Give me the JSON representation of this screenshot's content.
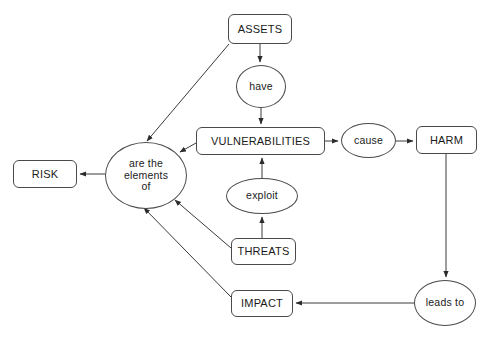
{
  "diagram": {
    "colors": {
      "background": "#ffffff",
      "node_fill": "#ffffff",
      "node_stroke": "#4a4a4a",
      "edge_stroke": "#3a3a3a",
      "text": "#1a1a1a"
    },
    "nodes": [
      {
        "id": "assets",
        "label": "ASSETS",
        "shape": "box",
        "x": 228,
        "y": 14,
        "w": 64,
        "h": 30
      },
      {
        "id": "have",
        "label": "have",
        "shape": "ellipse",
        "x": 236,
        "y": 65,
        "w": 50,
        "h": 43
      },
      {
        "id": "vulnerabilities",
        "label": "VULNERABILITIES",
        "shape": "box",
        "x": 196,
        "y": 127,
        "w": 129,
        "h": 28
      },
      {
        "id": "cause",
        "label": "cause",
        "shape": "ellipse",
        "x": 341,
        "y": 123,
        "w": 55,
        "h": 35
      },
      {
        "id": "harm",
        "label": "HARM",
        "shape": "box",
        "x": 416,
        "y": 126,
        "w": 61,
        "h": 28
      },
      {
        "id": "risk",
        "label": "RISK",
        "shape": "box",
        "x": 13,
        "y": 160,
        "w": 64,
        "h": 28
      },
      {
        "id": "elements",
        "label": "are the\nelements\nof",
        "shape": "ellipse",
        "x": 105,
        "y": 142,
        "w": 82,
        "h": 67
      },
      {
        "id": "exploit",
        "label": "exploit",
        "shape": "ellipse",
        "x": 226,
        "y": 178,
        "w": 72,
        "h": 36
      },
      {
        "id": "threats",
        "label": "THREATS",
        "shape": "box",
        "x": 231,
        "y": 238,
        "w": 65,
        "h": 27
      },
      {
        "id": "impact",
        "label": "IMPACT",
        "shape": "box",
        "x": 231,
        "y": 290,
        "w": 62,
        "h": 27
      },
      {
        "id": "leads_to",
        "label": "leads to",
        "shape": "ellipse",
        "x": 414,
        "y": 280,
        "w": 62,
        "h": 46
      }
    ],
    "edges": [
      {
        "id": "assets-have",
        "from": "assets",
        "to": "have",
        "path": "M 260,44 L 260,62",
        "arrow": true
      },
      {
        "id": "assets-elements",
        "from": "assets",
        "to": "elements",
        "path": "M 229,44 L 147,141",
        "arrow": true
      },
      {
        "id": "have-vulnerabilities",
        "from": "have",
        "to": "vulnerabilities",
        "path": "M 261,108 L 261,124",
        "arrow": true
      },
      {
        "id": "vulnerabilities-elements",
        "from": "vulnerabilities",
        "to": "elements",
        "path": "M 196,143 L 180,152",
        "arrow": true
      },
      {
        "id": "vulnerabilities-cause",
        "from": "vulnerabilities",
        "to": "cause",
        "path": "M 325,141 L 338,141",
        "arrow": true
      },
      {
        "id": "cause-harm",
        "from": "cause",
        "to": "harm",
        "path": "M 396,141 L 413,141",
        "arrow": true
      },
      {
        "id": "harm-leads_to",
        "from": "harm",
        "to": "leads_to",
        "path": "M 446,154 L 446,277",
        "arrow": true
      },
      {
        "id": "leads_to-impact",
        "from": "leads_to",
        "to": "impact",
        "path": "M 414,303 L 296,303",
        "arrow": true
      },
      {
        "id": "impact-elements",
        "from": "impact",
        "to": "elements",
        "path": "M 231,297 L 144,208",
        "arrow": true
      },
      {
        "id": "threats-elements",
        "from": "threats",
        "to": "elements",
        "path": "M 231,248 L 175,200",
        "arrow": true
      },
      {
        "id": "threats-exploit",
        "from": "threats",
        "to": "exploit",
        "path": "M 262,238 L 262,217",
        "arrow": true
      },
      {
        "id": "exploit-vulnerabilities",
        "from": "exploit",
        "to": "vulnerabilities",
        "path": "M 262,178 L 262,158",
        "arrow": true
      },
      {
        "id": "elements-risk",
        "from": "elements",
        "to": "risk",
        "path": "M 105,174 L 80,174",
        "arrow": true
      }
    ]
  }
}
